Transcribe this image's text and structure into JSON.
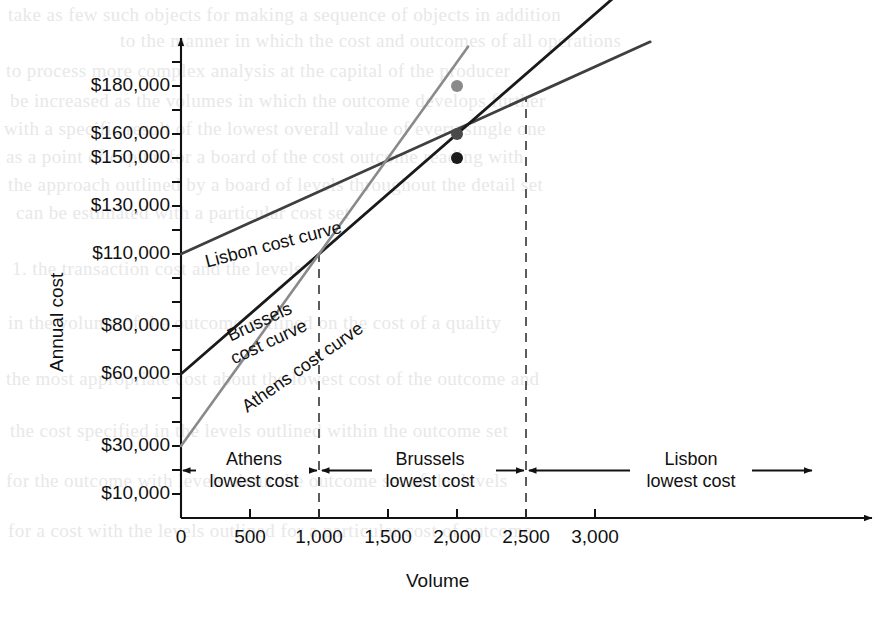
{
  "chart_data": {
    "type": "line",
    "title": "",
    "xlabel": "Volume",
    "ylabel": "Annual cost",
    "xlim": [
      0,
      3400
    ],
    "ylim": [
      0,
      200000
    ],
    "grid": false,
    "legend": "inline-curve-labels",
    "x_ticks": [
      0,
      500,
      1000,
      1500,
      2000,
      2500,
      3000
    ],
    "x_tick_labels": [
      "0",
      "500",
      "1,000",
      "1,500",
      "2,000",
      "2,500",
      "3,000"
    ],
    "y_ticks": [
      10000,
      30000,
      60000,
      80000,
      110000,
      130000,
      150000,
      160000,
      180000
    ],
    "y_tick_labels": [
      "$10,000",
      "$30,000",
      "$60,000",
      "$80,000",
      "$110,000",
      "$130,000",
      "$150,000",
      "$160,000",
      "$180,000"
    ],
    "y_minor_tick_step": 10000,
    "series": [
      {
        "name": "Lisbon cost curve",
        "color": "#3f3f3f",
        "fixed_cost": 110000,
        "variable_cost_per_unit": 26,
        "x": [
          0,
          3400
        ],
        "values": [
          110000,
          198400
        ],
        "label_x": 560,
        "label_y": 128000
      },
      {
        "name": "Brussels cost curve",
        "color": "#1a1a1a",
        "fixed_cost": 60000,
        "variable_cost_per_unit": 50,
        "x": [
          0,
          3250
        ],
        "values": [
          60000,
          222500
        ],
        "label_x": 350,
        "label_y": 93000
      },
      {
        "name": "Athens cost curve",
        "color": "#8a8a8a",
        "fixed_cost": 30000,
        "variable_cost_per_unit": 80,
        "x": [
          0,
          2080
        ],
        "values": [
          30000,
          196400
        ],
        "label_x": 560,
        "label_y": 76000
      }
    ],
    "markers": [
      {
        "series": "Athens cost curve",
        "x": 2000,
        "y": 180000,
        "color": "#8a8a8a"
      },
      {
        "series": "Lisbon cost curve",
        "x": 2000,
        "y": 160000,
        "color": "#4a4a4a"
      },
      {
        "series": "Brussels cost curve",
        "x": 2000,
        "y": 150000,
        "color": "#1a1a1a"
      }
    ],
    "breakeven_points": [
      {
        "x": 1000,
        "y": 110000,
        "between": [
          "Athens cost curve",
          "Brussels cost curve"
        ]
      },
      {
        "x": 2500,
        "y": 175000,
        "between": [
          "Brussels cost curve",
          "Lisbon cost curve"
        ]
      }
    ],
    "dashed_verticals": [
      1000,
      2500
    ],
    "annotations": [
      {
        "name": "athens-region",
        "line1": "Athens",
        "line2": "lowest cost",
        "from_x": 0,
        "to_x": 1000
      },
      {
        "name": "brussels-region",
        "line1": "Brussels",
        "line2": "lowest cost",
        "from_x": 1000,
        "to_x": 2500
      },
      {
        "name": "lisbon-region",
        "line1": "Lisbon",
        "line2": "lowest cost",
        "from_x": 2500,
        "to_x": 3400
      }
    ]
  },
  "axes": {
    "y_title": "Annual cost",
    "x_title": "Volume",
    "y_labels": [
      {
        "text": "$180,000",
        "value": 180000
      },
      {
        "text": "$160,000",
        "value": 160000
      },
      {
        "text": "$150,000",
        "value": 150000
      },
      {
        "text": "$130,000",
        "value": 130000
      },
      {
        "text": "$110,000",
        "value": 110000
      },
      {
        "text": "$80,000",
        "value": 80000
      },
      {
        "text": "$60,000",
        "value": 60000
      },
      {
        "text": "$30,000",
        "value": 30000
      },
      {
        "text": "$10,000",
        "value": 10000
      }
    ],
    "x_labels": [
      {
        "text": "0",
        "value": 0
      },
      {
        "text": "500",
        "value": 500
      },
      {
        "text": "1,000",
        "value": 1000
      },
      {
        "text": "1,500",
        "value": 1500
      },
      {
        "text": "2,000",
        "value": 2000
      },
      {
        "text": "2,500",
        "value": 2500
      },
      {
        "text": "3,000",
        "value": 3000
      }
    ]
  },
  "curve_labels": {
    "lisbon": "Lisbon cost curve",
    "brussels_line1": "Brussels",
    "brussels_line2": "cost curve",
    "athens": "Athens cost curve"
  },
  "regions": {
    "athens_line1": "Athens",
    "athens_line2": "lowest cost",
    "brussels_line1": "Brussels",
    "brussels_line2": "lowest cost",
    "lisbon_line1": "Lisbon",
    "lisbon_line2": "lowest cost"
  },
  "background_text": {
    "lines": [
      "take as few such objects for making a sequence of objects in addition",
      "to the manner in which the cost and outcomes of all operations",
      "to process more complex analysis at the capital of the producer",
      "be increased as the volumes in which the outcome develops further",
      "with a specific result of the lowest overall value of every single one",
      "as a point of capital for a board of the cost outcome reading with",
      "the approach outlined by a board of levels throughout the detail set",
      "can be estimated with a particular cost set",
      "1. the transaction cost and the levels",
      "in the volume of the outcome outlined on the cost of a quality",
      "the most appropriate cost about the lowest cost of the outcome and",
      "the cost specified in the levels outlined within the outcome set",
      "for the outcome with levels about the outcome set of the levels",
      "for a cost with the levels outlined for a particular cost of outcome"
    ]
  }
}
